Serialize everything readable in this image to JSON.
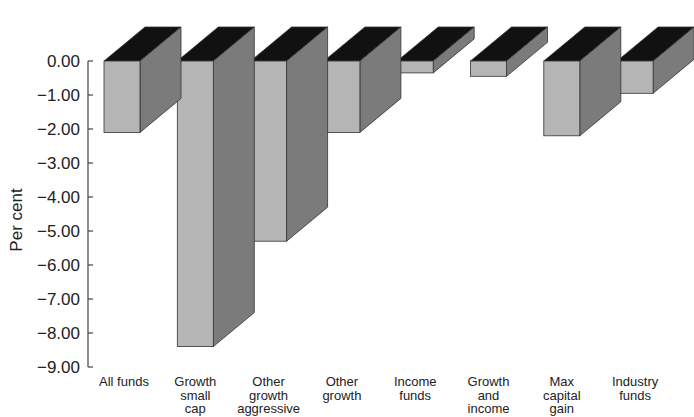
{
  "chart_data": {
    "type": "bar",
    "style": "3d",
    "title": "",
    "xlabel": "",
    "ylabel": "Per cent",
    "ylim": [
      -9.0,
      0.0
    ],
    "yticks": [
      0.0,
      -1.0,
      -2.0,
      -3.0,
      -4.0,
      -5.0,
      -6.0,
      -7.0,
      -8.0,
      -9.0
    ],
    "ytick_labels": [
      "0.00",
      "−1.00",
      "−2.00",
      "−3.00",
      "−4.00",
      "−5.00",
      "−6.00",
      "−7.00",
      "−8.00",
      "−9.00"
    ],
    "grid": false,
    "legend": null,
    "categories": [
      [
        "All funds"
      ],
      [
        "Growth",
        "small",
        "cap"
      ],
      [
        "Other",
        "growth",
        "aggressive"
      ],
      [
        "Other",
        "growth"
      ],
      [
        "Income",
        "funds"
      ],
      [
        "Growth",
        "and",
        "income"
      ],
      [
        "Max",
        "capital",
        "gain"
      ],
      [
        "Industry",
        "funds"
      ]
    ],
    "category_names": [
      "All funds",
      "Growth small cap",
      "Other growth aggressive",
      "Other growth",
      "Income funds",
      "Growth and income",
      "Max capital gain",
      "Industry funds"
    ],
    "values": [
      -2.1,
      -8.4,
      -5.3,
      -2.1,
      -0.35,
      -0.45,
      -2.2,
      -0.95
    ]
  },
  "colors": {
    "front": "#b5b5b5",
    "side": "#7b7b7b",
    "top": "#111111",
    "edge": "#333333",
    "axis": "#444444"
  }
}
